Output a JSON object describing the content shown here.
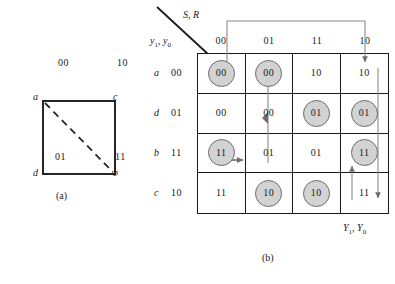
{
  "figure": {
    "part_a": {
      "caption": "(a)",
      "nodes": [
        {
          "id": "a",
          "label": "a",
          "position": "top-left"
        },
        {
          "id": "c",
          "label": "c",
          "position": "top-right"
        },
        {
          "id": "d",
          "label": "d",
          "position": "bottom-left"
        },
        {
          "id": "b",
          "label": "b",
          "position": "bottom-right"
        }
      ],
      "edge_labels": [
        {
          "id": "top",
          "label": "00"
        },
        {
          "id": "right",
          "label": "10"
        },
        {
          "id": "left",
          "label": "01"
        },
        {
          "id": "bottom",
          "label": "11"
        }
      ],
      "edges": [
        {
          "from": "a",
          "to": "c",
          "style": "solid"
        },
        {
          "from": "a",
          "to": "d",
          "style": "solid"
        },
        {
          "from": "c",
          "to": "b",
          "style": "solid"
        },
        {
          "from": "d",
          "to": "b",
          "style": "solid"
        },
        {
          "from": "a",
          "to": "b",
          "style": "dashed"
        }
      ]
    },
    "part_b": {
      "caption": "(b)",
      "column_axis_label": "S, R",
      "row_axis_label": "y1, y0",
      "output_label": "Y1, Y0",
      "column_headers": [
        "00",
        "01",
        "11",
        "10"
      ],
      "rows": [
        {
          "state": "a",
          "code": "00",
          "cells": [
            {
              "value": "00",
              "circled": true
            },
            {
              "value": "00",
              "circled": true
            },
            {
              "value": "10",
              "circled": false
            },
            {
              "value": "10",
              "circled": false
            }
          ]
        },
        {
          "state": "d",
          "code": "01",
          "cells": [
            {
              "value": "00",
              "circled": false
            },
            {
              "value": "00",
              "circled": false
            },
            {
              "value": "01",
              "circled": true
            },
            {
              "value": "01",
              "circled": true
            }
          ]
        },
        {
          "state": "b",
          "code": "11",
          "cells": [
            {
              "value": "11",
              "circled": true
            },
            {
              "value": "01",
              "circled": false
            },
            {
              "value": "01",
              "circled": false
            },
            {
              "value": "11",
              "circled": true
            }
          ]
        },
        {
          "state": "c",
          "code": "10",
          "cells": [
            {
              "value": "11",
              "circled": false
            },
            {
              "value": "10",
              "circled": true
            },
            {
              "value": "10",
              "circled": true
            },
            {
              "value": "11",
              "circled": false
            }
          ]
        }
      ]
    }
  },
  "colors": {
    "circle_fill": "#d2d2d2",
    "circle_stroke": "#6b6b6b",
    "grid_line": "#1a1a1a",
    "arrow": "#7a7a7a",
    "text": "#1a1a1a"
  }
}
